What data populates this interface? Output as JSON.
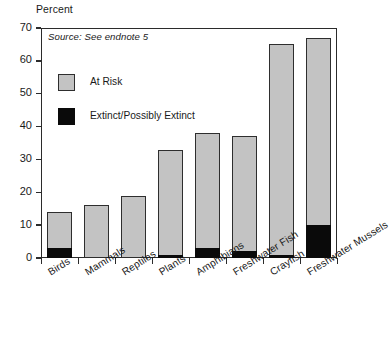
{
  "chart_data": {
    "type": "bar",
    "stacked": true,
    "title": "",
    "subtitle": "",
    "axis_title": "Percent",
    "source_note": "Source: See endnote 5",
    "xlabel": "",
    "ylabel": "Percent",
    "ylim": [
      0,
      70
    ],
    "yticks": [
      0,
      10,
      20,
      30,
      40,
      50,
      60,
      70
    ],
    "grid": false,
    "legend_position": "inside-upper-left",
    "categories": [
      "Birds",
      "Mammals",
      "Reptiles",
      "Plants",
      "Amphibians",
      "Freshwater Fish",
      "Crayfish",
      "Freshwater Mussels"
    ],
    "series": [
      {
        "name": "Extinct/Possibly Extinct",
        "color": "#0a0a0a",
        "values": [
          3,
          0,
          0,
          1,
          3,
          2,
          1,
          10
        ]
      },
      {
        "name": "At Risk",
        "color": "#c3c3c3",
        "values": [
          11,
          16,
          19,
          32,
          35,
          35,
          64,
          57
        ]
      }
    ],
    "totals": [
      14,
      16,
      19,
      33,
      38,
      37,
      65,
      67
    ]
  },
  "legend": {
    "items": [
      {
        "label": "At Risk",
        "swatch": "gray-swatch"
      },
      {
        "label": "Extinct/Possibly Extinct",
        "swatch": "black-swatch"
      }
    ]
  }
}
